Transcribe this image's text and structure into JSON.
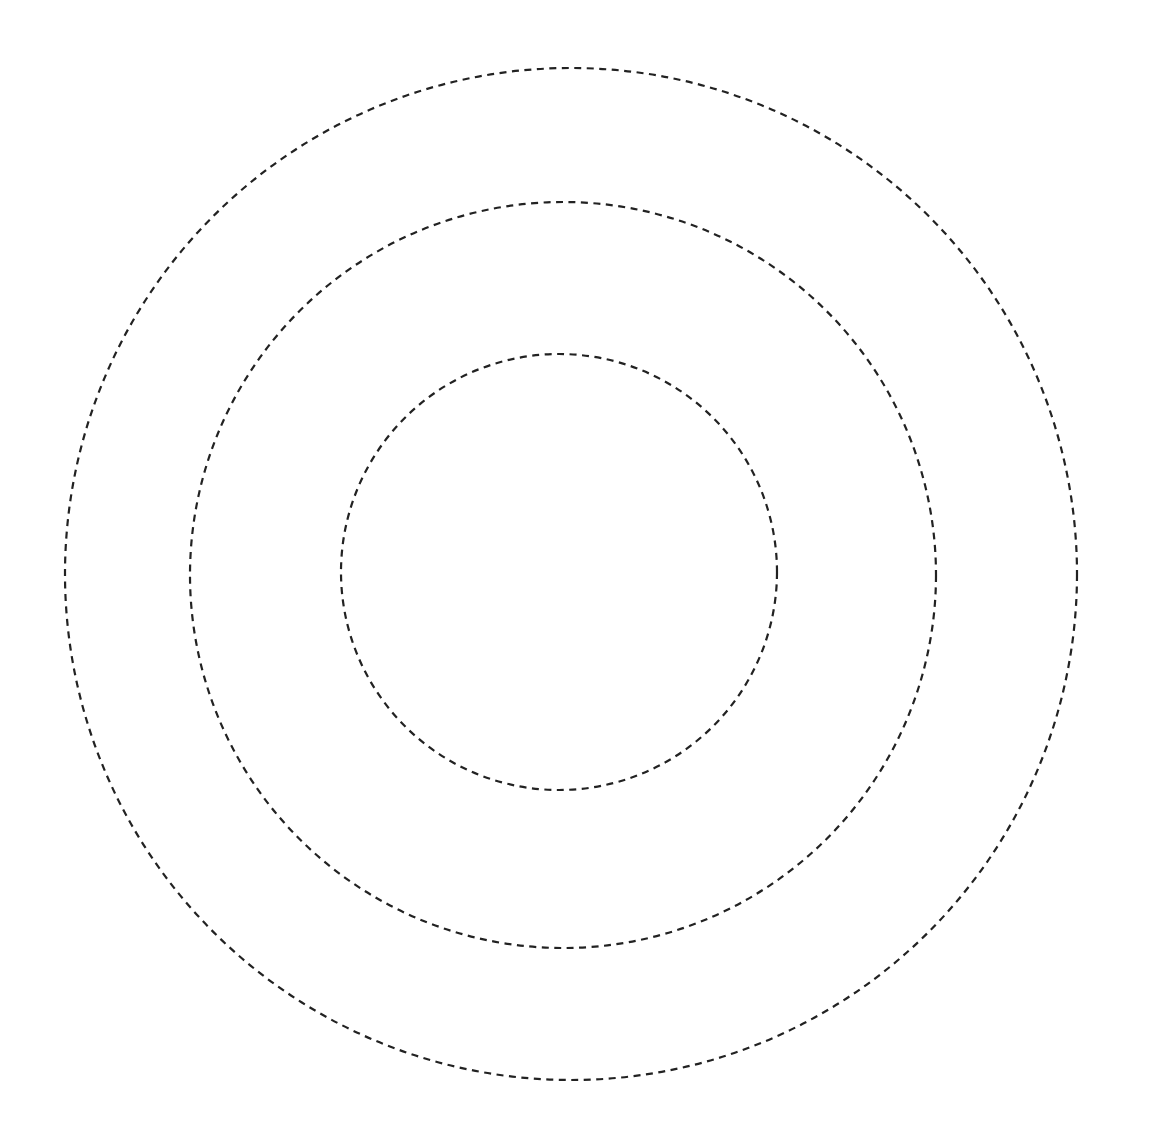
{
  "canvas": {
    "width": 1150,
    "height": 1136,
    "background": "#ffffff"
  },
  "style": {
    "stroke": "#222222",
    "stroke_width": 2.2,
    "dasharray": "7 5.5"
  },
  "circles": [
    {
      "name": "outer-circle",
      "cx": 571,
      "cy": 574,
      "r": 506
    },
    {
      "name": "middle-circle",
      "cx": 563,
      "cy": 575,
      "r": 373
    },
    {
      "name": "inner-circle",
      "cx": 559,
      "cy": 572,
      "r": 218
    }
  ]
}
